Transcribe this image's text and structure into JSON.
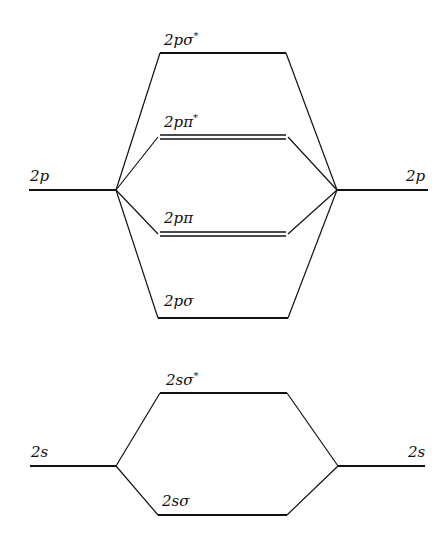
{
  "diagram": {
    "type": "molecular-orbital-energy-diagram",
    "atomic_orbitals": {
      "left": [
        {
          "label": "2p"
        },
        {
          "label": "2s"
        }
      ],
      "right": [
        {
          "label": "2p"
        },
        {
          "label": "2s"
        }
      ]
    },
    "molecular_orbitals": [
      {
        "id": "2p_sigma_star",
        "base": "2pσ",
        "sup": "*",
        "degenerate": 1
      },
      {
        "id": "2p_pi_star",
        "base": "2pπ",
        "sup": "*",
        "degenerate": 2
      },
      {
        "id": "2p_pi",
        "base": "2pπ",
        "sup": "",
        "degenerate": 2
      },
      {
        "id": "2p_sigma",
        "base": "2pσ",
        "sup": "",
        "degenerate": 1
      },
      {
        "id": "2s_sigma_star",
        "base": "2sσ",
        "sup": "*",
        "degenerate": 1
      },
      {
        "id": "2s_sigma",
        "base": "2sσ",
        "sup": "",
        "degenerate": 1
      }
    ],
    "colors": {
      "line": "#111111",
      "background": "#ffffff"
    }
  }
}
